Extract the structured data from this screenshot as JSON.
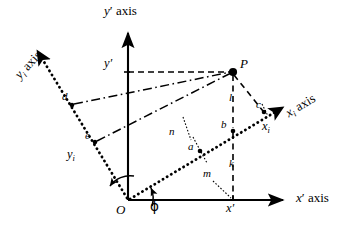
{
  "figure": {
    "type": "geometry-diagram",
    "width": 364,
    "height": 233,
    "background_color": "#ffffff",
    "stroke_color": "#000000"
  },
  "axes": [
    {
      "id": "x-prime",
      "label_main": "x",
      "label_prime": "′",
      "label_suffix": " axis",
      "style": "solid",
      "from": [
        128,
        200
      ],
      "to": [
        290,
        200
      ],
      "arrow": "end",
      "label_pos": [
        296,
        193
      ]
    },
    {
      "id": "y-prime",
      "label_main": "y",
      "label_prime": "′",
      "label_suffix": " axis",
      "style": "solid",
      "from": [
        128,
        200
      ],
      "to": [
        128,
        27
      ],
      "arrow": "end",
      "label_pos": [
        104,
        5
      ]
    },
    {
      "id": "x-i",
      "label_main": "x",
      "label_sub": "i",
      "label_suffix": " axis",
      "style": "dotted-heavy",
      "from": [
        128,
        200
      ],
      "to": [
        288,
        104
      ],
      "arrow": "end",
      "label_pos": [
        297,
        96
      ],
      "rotation_deg": -31
    },
    {
      "id": "y-i",
      "label_main": "y",
      "label_sub": "i",
      "label_suffix": " axis",
      "style": "dotted-heavy",
      "from": [
        128,
        200
      ],
      "to": [
        33,
        44
      ],
      "arrow": "end",
      "label_pos": [
        10,
        70
      ],
      "rotation_deg": -58
    }
  ],
  "points": [
    {
      "id": "origin",
      "label": "O",
      "x": 128,
      "y": 200,
      "label_pos": [
        118,
        205
      ],
      "marker": "none"
    },
    {
      "id": "P",
      "label": "P",
      "x": 233,
      "y": 72,
      "label_pos": [
        240,
        58
      ],
      "marker": "dot"
    },
    {
      "id": "a",
      "label": "a",
      "x": 200,
      "y": 150,
      "label_pos": [
        190,
        146
      ],
      "marker": "dot"
    },
    {
      "id": "b",
      "label": "b",
      "x": 233,
      "y": 130,
      "label_pos": [
        223,
        124
      ],
      "marker": "dot"
    },
    {
      "id": "c",
      "label": "c",
      "x": 264,
      "y": 112,
      "label_pos": [
        258,
        104
      ],
      "marker": "dot"
    },
    {
      "id": "d",
      "label": "d",
      "x": 73,
      "y": 104,
      "label_pos": [
        63,
        96
      ],
      "marker": "dot"
    },
    {
      "id": "e",
      "label": "e",
      "x": 96,
      "y": 141,
      "label_pos": [
        86,
        135
      ],
      "marker": "dot"
    }
  ],
  "segment_labels": [
    {
      "id": "l",
      "label": "l",
      "pos": [
        231,
        97
      ]
    },
    {
      "id": "k",
      "label": "k",
      "pos": [
        231,
        164
      ]
    },
    {
      "id": "m",
      "label": "m",
      "pos": [
        208,
        174
      ]
    },
    {
      "id": "n",
      "label": "n",
      "pos": [
        172,
        132
      ]
    }
  ],
  "coordinate_labels": [
    {
      "id": "y-prime-value",
      "text": "y",
      "prime": "′",
      "pos": [
        106,
        62
      ]
    },
    {
      "id": "x-prime-value",
      "text": "x",
      "prime": "′",
      "pos": [
        226,
        205
      ]
    },
    {
      "id": "x-i-value",
      "text": "x",
      "sub": "i",
      "pos": [
        263,
        124
      ]
    },
    {
      "id": "y-i-value",
      "text": "y",
      "sub": "i",
      "pos": [
        70,
        154
      ]
    }
  ],
  "angle": {
    "id": "phi",
    "symbol": "ϕ",
    "label_pos": [
      151,
      202
    ],
    "between": [
      "x-prime",
      "x-i"
    ],
    "vertex": [
      128,
      200
    ]
  },
  "arcs": [
    {
      "id": "phi-arc-x",
      "vertex": [
        128,
        200
      ],
      "from_deg": 0,
      "to_deg": -31,
      "radius": 24
    },
    {
      "id": "phi-arc-y",
      "vertex": [
        128,
        200
      ],
      "from_deg": 90,
      "to_deg": 122,
      "radius": 22
    }
  ],
  "construction_lines": [
    {
      "id": "P-to-y-prime-axis",
      "style": "dashed",
      "from": [
        233,
        72
      ],
      "to": [
        128,
        72
      ]
    },
    {
      "id": "P-to-b-vertical",
      "style": "dashed",
      "from": [
        233,
        72
      ],
      "to": [
        233,
        130
      ]
    },
    {
      "id": "b-to-x-prime-vertical",
      "style": "dashed",
      "from": [
        233,
        130
      ],
      "to": [
        233,
        200
      ]
    },
    {
      "id": "P-to-c",
      "style": "dashed",
      "from": [
        233,
        72
      ],
      "to": [
        264,
        112
      ]
    },
    {
      "id": "d-to-P",
      "style": "dash-dot",
      "from": [
        73,
        104
      ],
      "to": [
        233,
        72
      ]
    },
    {
      "id": "e-to-P",
      "style": "dash-dot",
      "from": [
        96,
        141
      ],
      "to": [
        233,
        72
      ]
    },
    {
      "id": "right-angle-n",
      "style": "dotted-thin",
      "from": [
        183,
        118
      ],
      "to": [
        190,
        140
      ]
    },
    {
      "id": "right-angle-a",
      "style": "dotted-thin",
      "from": [
        192,
        138
      ],
      "to": [
        205,
        162
      ]
    },
    {
      "id": "right-angle-m",
      "style": "dotted-thin",
      "from": [
        214,
        182
      ],
      "to": [
        231,
        197
      ]
    }
  ]
}
